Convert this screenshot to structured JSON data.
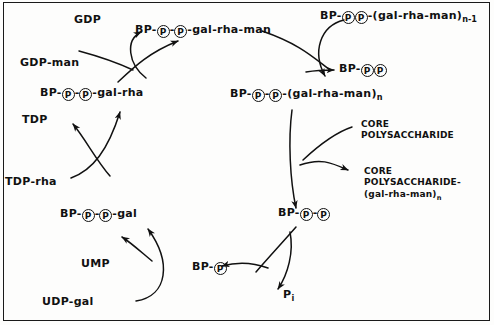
{
  "figure": {
    "border_color": "#1a1a1a",
    "ink_color": "#111111",
    "background": "#fdfdfc"
  },
  "nodes": {
    "gdp": "GDP",
    "gdp_man": "GDP-man",
    "tdp": "TDP",
    "tdp_rha": "TDP-rha",
    "ump": "UMP",
    "udp_gal": "UDP-gal",
    "pi": "P",
    "pi_sub": "i",
    "core_polysaccharide": "CORE\nPOLYSACCHARIDE",
    "core_polysaccharide_line1": "CORE",
    "core_polysaccharide_line2": "POLYSACCHARIDE",
    "core_product_line1": "CORE",
    "core_product_line2": "POLYSACCHARIDE-",
    "core_product_line3": "(gal-rha-man)",
    "core_product_sub": "n"
  },
  "carriers": {
    "bp_pp_gal_rha_man": {
      "prefix": "BP-",
      "p1": "P",
      "sep1": "-",
      "p2": "P",
      "suffix": "-gal-rha-man"
    },
    "bp_pp_gal_rha": {
      "prefix": "BP-",
      "p1": "P",
      "sep1": "-",
      "p2": "P",
      "suffix": "-gal-rha"
    },
    "bp_pp_gal": {
      "prefix": "BP-",
      "p1": "P",
      "sep1": "-",
      "p2": "P",
      "suffix": "-gal"
    },
    "bp_p": {
      "prefix": "BP-",
      "p1": "P"
    },
    "bp_pp": {
      "prefix": "BP-",
      "p1": "P",
      "sep1": "-",
      "p2": "P"
    },
    "bp_pp_right": {
      "prefix": "BP-",
      "p1": "P",
      "sep1": "",
      "p2": "P"
    },
    "bp_pp_gal_rha_man_n": {
      "prefix": "BP-",
      "p1": "P",
      "sep1": "-",
      "p2": "P",
      "suffix": "-(gal-rha-man)",
      "sub": "n"
    },
    "bp_pp_gal_rha_man_n1": {
      "prefix": "BP-",
      "p1": "P",
      "sep1": "",
      "p2": "P",
      "suffix": "-(gal-rha-man)",
      "sub": "n-1"
    }
  },
  "icons": {
    "phosphate": "phosphate-circle-icon",
    "arrow": "arrow-head-icon"
  }
}
